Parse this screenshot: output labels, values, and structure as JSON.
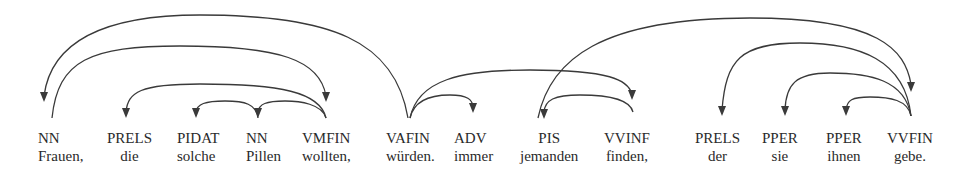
{
  "diagram": {
    "type": "dependency-parse",
    "tokens": [
      {
        "tag": "NN",
        "word": "Frauen,",
        "x": 38
      },
      {
        "tag": "PRELS",
        "word": "die",
        "x": 107
      },
      {
        "tag": "PIDAT",
        "word": "solche",
        "x": 177
      },
      {
        "tag": "NN",
        "word": "Pillen",
        "x": 246
      },
      {
        "tag": "VMFIN",
        "word": "wollten,",
        "x": 302
      },
      {
        "tag": "VAFIN",
        "word": "würden.",
        "x": 386
      },
      {
        "tag": "ADV",
        "word": "immer",
        "x": 454
      },
      {
        "tag": "PIS",
        "word": "jemanden",
        "x": 520
      },
      {
        "tag": "VVINF",
        "word": "finden,",
        "x": 604
      },
      {
        "tag": "PRELS",
        "word": "der",
        "x": 695
      },
      {
        "tag": "PPER",
        "word": "sie",
        "x": 762
      },
      {
        "tag": "PPER",
        "word": "ihnen",
        "x": 826
      },
      {
        "tag": "VVFIN",
        "word": "gebe.",
        "x": 887
      }
    ],
    "arcs": [
      {
        "from": 5,
        "to": 0,
        "label": "VAFIN → NN (Frauen)"
      },
      {
        "from": 0,
        "to": 4,
        "label": "NN (Frauen) → VMFIN"
      },
      {
        "from": 4,
        "to": 1,
        "label": "VMFIN → PRELS"
      },
      {
        "from": 4,
        "to": 3,
        "label": "VMFIN → NN (Pillen)"
      },
      {
        "from": 3,
        "to": 2,
        "label": "NN (Pillen) → PIDAT"
      },
      {
        "from": 5,
        "to": 8,
        "label": "VAFIN → VVINF"
      },
      {
        "from": 5,
        "to": 6,
        "label": "VAFIN → ADV"
      },
      {
        "from": 8,
        "to": 7,
        "label": "VVINF → PIS"
      },
      {
        "from": 7,
        "to": 12,
        "label": "PIS → VVFIN"
      },
      {
        "from": 12,
        "to": 9,
        "label": "VVFIN → PRELS"
      },
      {
        "from": 12,
        "to": 10,
        "label": "VVFIN → PPER (sie)"
      },
      {
        "from": 12,
        "to": 11,
        "label": "VVFIN → PPER (ihnen)"
      }
    ],
    "colors": {
      "ink": "#3a3a3a",
      "text": "#2a2a2a",
      "background": "#ffffff"
    }
  }
}
